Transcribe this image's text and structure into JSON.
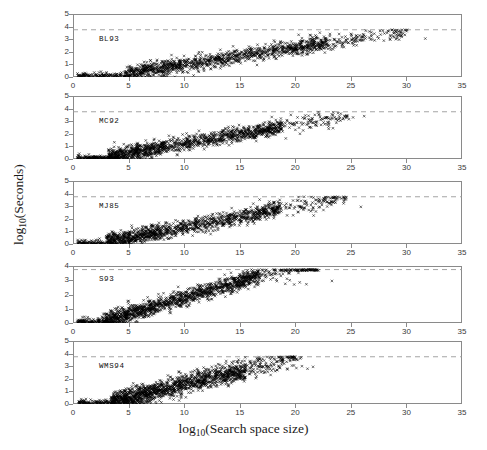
{
  "figure": {
    "xlabel_prefix": "log",
    "xlabel_sub": "10",
    "xlabel_rest": "(Search space size)",
    "ylabel_prefix": "log",
    "ylabel_sub": "10",
    "ylabel_rest": "(Seconds)",
    "marker": "x-marker",
    "background": "#ffffff",
    "frame_color": "#8a8a8a",
    "marker_color": "#000000",
    "threshold_color": "#9a9a9a"
  },
  "chart_data": {
    "type": "scatter",
    "title": "",
    "xlabel": "log10(Search space size)",
    "ylabel": "log10(Seconds)",
    "xlim": [
      0,
      35
    ],
    "ylim": [
      0,
      5
    ],
    "xticks": [
      0,
      5,
      10,
      15,
      20,
      25,
      30,
      35
    ],
    "yticks": [
      0,
      1,
      2,
      3,
      4,
      5
    ],
    "grid": false,
    "legend": "panel-inset-label",
    "threshold_line": {
      "value": 3.75,
      "style": "dashed",
      "label": "timeout cutoff"
    },
    "panels": [
      {
        "label": "BL93",
        "yticks": [
          0,
          1,
          2,
          3,
          4,
          5
        ],
        "x_max_observed": 31.7,
        "knee_x": 4.6,
        "slope": 0.135,
        "intercept": -0.38,
        "spread": 0.3,
        "n_points": 1400,
        "seed": 11,
        "cap": 3.75,
        "tail_points": [
          [
            20.3,
            3.35
          ],
          [
            20.6,
            3.08
          ],
          [
            21.4,
            3.3
          ],
          [
            21.9,
            3.2
          ],
          [
            22.3,
            2.95
          ],
          [
            23.1,
            3.25
          ],
          [
            23.8,
            2.82
          ],
          [
            24.2,
            3.15
          ],
          [
            25.1,
            2.7
          ],
          [
            25.8,
            3.3
          ],
          [
            26.0,
            2.9
          ],
          [
            27.4,
            3.2
          ],
          [
            29.3,
            3.3
          ],
          [
            31.7,
            3.05
          ]
        ]
      },
      {
        "label": "MC92",
        "yticks": [
          0,
          1,
          2,
          3,
          4,
          5
        ],
        "x_max_observed": 26.2,
        "knee_x": 3.2,
        "slope": 0.15,
        "intercept": -0.3,
        "spread": 0.3,
        "n_points": 1400,
        "seed": 23,
        "cap": 3.75,
        "tail_points": [
          [
            19.6,
            3.5
          ],
          [
            20.2,
            3.3
          ],
          [
            20.9,
            3.45
          ],
          [
            21.5,
            3.2
          ],
          [
            22.1,
            3.55
          ],
          [
            22.8,
            3.3
          ],
          [
            23.4,
            3.5
          ],
          [
            24.0,
            3.25
          ],
          [
            24.6,
            3.45
          ],
          [
            25.2,
            3.3
          ],
          [
            26.2,
            3.4
          ]
        ]
      },
      {
        "label": "MJ85",
        "yticks": [
          0,
          1,
          2,
          3,
          4,
          5
        ],
        "x_max_observed": 25.9,
        "knee_x": 3.0,
        "slope": 0.165,
        "intercept": -0.32,
        "spread": 0.32,
        "n_points": 1350,
        "seed": 37,
        "cap": 3.75,
        "tail_points": [
          [
            18.6,
            3.5
          ],
          [
            19.2,
            3.2
          ],
          [
            19.8,
            3.45
          ],
          [
            20.4,
            3.0
          ],
          [
            21.0,
            3.3
          ],
          [
            21.6,
            2.85
          ],
          [
            22.4,
            3.1
          ],
          [
            25.9,
            2.95
          ]
        ]
      },
      {
        "label": "S93",
        "yticks": [
          0,
          1,
          2,
          3,
          4
        ],
        "x_max_observed": 23.3,
        "knee_x": 2.6,
        "slope": 0.228,
        "intercept": -0.52,
        "spread": 0.3,
        "n_points": 1500,
        "seed": 51,
        "cap": 3.75,
        "tail_points": [
          [
            17.9,
            3.4
          ],
          [
            18.3,
            3.05
          ],
          [
            18.7,
            3.3
          ],
          [
            19.1,
            2.75
          ],
          [
            19.5,
            3.0
          ],
          [
            19.9,
            2.7
          ],
          [
            20.4,
            2.85
          ],
          [
            21.0,
            2.72
          ],
          [
            23.3,
            2.95
          ]
        ]
      },
      {
        "label": "WMS94",
        "yticks": [
          0,
          1,
          2,
          3,
          4,
          5
        ],
        "x_max_observed": 21.6,
        "knee_x": 3.4,
        "slope": 0.213,
        "intercept": -0.56,
        "spread": 0.4,
        "n_points": 1600,
        "seed": 73,
        "cap": 3.75,
        "tail_points": [
          [
            17.2,
            3.45
          ],
          [
            17.8,
            3.1
          ],
          [
            18.3,
            3.35
          ],
          [
            18.6,
            2.9
          ],
          [
            19.0,
            3.2
          ],
          [
            19.3,
            2.75
          ],
          [
            19.7,
            3.05
          ],
          [
            20.1,
            2.85
          ],
          [
            20.6,
            3.0
          ],
          [
            21.1,
            2.8
          ],
          [
            21.6,
            2.95
          ]
        ]
      }
    ]
  },
  "panel_geometry": [
    {
      "top": 14,
      "height": 63
    },
    {
      "top": 96,
      "height": 63
    },
    {
      "top": 181,
      "height": 63
    },
    {
      "top": 266,
      "height": 57
    },
    {
      "top": 341,
      "height": 63
    }
  ]
}
